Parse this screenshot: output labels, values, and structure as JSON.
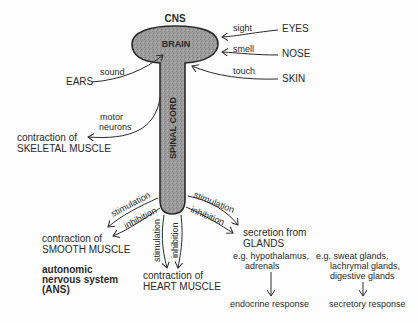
{
  "diagram": {
    "title": "CNS",
    "brain_label": "BRAIN",
    "cord_label": "SPINAL CORD",
    "colors": {
      "tissue_fill": "#9a9a9a",
      "outline": "#2a2a2a",
      "background": "#fdfdfd"
    },
    "inputs": [
      {
        "organ": "EYES",
        "sense": "sight"
      },
      {
        "organ": "NOSE",
        "sense": "smell"
      },
      {
        "organ": "SKIN",
        "sense": "touch"
      },
      {
        "organ": "EARS",
        "sense": "sound"
      }
    ],
    "motor": {
      "pathway": "motor",
      "pathway2": "neurons",
      "line1": "contraction of",
      "line2": "SKELETAL MUSCLE"
    },
    "ans": {
      "line1": "autonomic",
      "line2": "nervous system",
      "line3": "(ANS)"
    },
    "outputs": {
      "smooth": {
        "line1": "contraction of",
        "line2": "SMOOTH MUSCLE",
        "arrow1": "stimulation",
        "arrow2": "inhibition"
      },
      "heart": {
        "line1": "contraction of",
        "line2": "HEART MUSCLE",
        "arrow1": "stimulation",
        "arrow2": "inhibition"
      },
      "glands": {
        "line1": "secretion from",
        "line2": "GLANDS",
        "arrow1": "stimulation",
        "arrow2": "inhibition"
      }
    },
    "endocrine": {
      "eg1": "e.g. hypothalamus,",
      "eg2": "adrenals",
      "response": "endocrine response"
    },
    "secretory": {
      "eg1": "e.g. sweat glands,",
      "eg2": "lachrymal glands,",
      "eg3": "digestive glands",
      "response": "secretory response"
    }
  }
}
